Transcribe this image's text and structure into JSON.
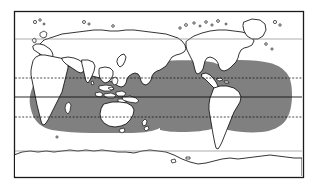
{
  "figure": {
    "kind": "world-distribution-map",
    "title": "",
    "caption": "",
    "background_color": "#ffffff",
    "frame_color": "#1a1a1a",
    "land_fill_color": "#ffffff",
    "coastline_color": "#111111",
    "range_fill_color": "#808080",
    "graticule_color": "#111111",
    "parallel_color": "#8a8a8a"
  },
  "map": {
    "projection": "equirectangular",
    "frame": {
      "x": 14,
      "y": 11,
      "width": 289,
      "height": 166
    },
    "lon_range": [
      -180,
      180
    ],
    "lat_range": [
      90,
      -90
    ]
  },
  "graticule": {
    "lines": [
      {
        "name": "northern-parallel",
        "label": "",
        "style": "solid-gray",
        "y": 39
      },
      {
        "name": "tropic-of-cancer",
        "label": "",
        "style": "dashed",
        "y": 78
      },
      {
        "name": "equator",
        "label": "",
        "style": "solid",
        "y": 97
      },
      {
        "name": "tropic-of-capricorn",
        "label": "",
        "style": "dashed",
        "y": 117
      },
      {
        "name": "antarctic-circle",
        "label": "",
        "style": "solid-gray",
        "y": 151
      }
    ]
  },
  "legend": {
    "visible": false,
    "entries": [
      {
        "swatch_color": "#808080",
        "label": ""
      }
    ]
  },
  "chart_data": {
    "type": "map",
    "title": "",
    "xlabel": "",
    "ylabel": "",
    "series": [
      {
        "name": "distribution-range",
        "color": "#808080",
        "description": "shaded tropical and subtropical oceanic band spanning the Indian, Pacific and Atlantic Oceans",
        "approx_lat_extent": [
          35,
          -35
        ]
      }
    ]
  }
}
